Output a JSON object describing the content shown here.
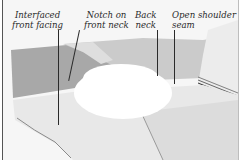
{
  "figure": {
    "callouts": [
      {
        "id": "interfaced-front-facing",
        "text": "Interfaced\nfront facing"
      },
      {
        "id": "notch-front-neck",
        "text": "Notch on\nfront neck"
      },
      {
        "id": "back-neck",
        "text": "Back\nneck"
      },
      {
        "id": "open-shoulder-seam",
        "text": "Open shoulder\nseam"
      }
    ],
    "colors": {
      "background": "#ffffff",
      "fabric_dark": "#a9a9a9",
      "fabric_mid": "#c9c9c9",
      "fabric_light": "#e6e6e6",
      "facing": "#ececec",
      "leader_line": "#2a2a2a",
      "label_text": "#2a2a2a"
    }
  }
}
